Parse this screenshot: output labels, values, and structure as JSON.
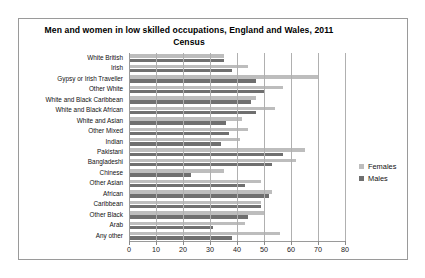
{
  "chart_data": {
    "type": "bar",
    "orientation": "horizontal",
    "title": "Men and women in low skilled occupations, England and Wales, 2011 Census",
    "title_line1": "Men and women in low skilled occupations, England and Wales, 2011",
    "title_line2": "Census",
    "xlabel": "",
    "ylabel": "",
    "xlim": [
      0,
      80
    ],
    "xticks": [
      0,
      10,
      20,
      30,
      40,
      50,
      60,
      70,
      80
    ],
    "grid": true,
    "legend_position": "right",
    "categories": [
      "White British",
      "Irish",
      "Gypsy or Irish Traveller",
      "Other White",
      "White and Black Caribbean",
      "White and Black African",
      "White and Asian",
      "Other Mixed",
      "Indian",
      "Pakistani",
      "Bangladeshi",
      "Chinese",
      "Other Asian",
      "African",
      "Caribbean",
      "Other Black",
      "Arab",
      "Any other"
    ],
    "series": [
      {
        "name": "Females",
        "color": "#bdbdbd",
        "values": [
          35,
          44,
          70,
          57,
          47,
          54,
          42,
          44,
          41,
          65,
          62,
          35,
          49,
          53,
          49,
          50,
          43,
          56
        ]
      },
      {
        "name": "Males",
        "color": "#6f6f6f",
        "values": [
          35,
          38,
          47,
          50,
          45,
          47,
          36,
          37,
          34,
          57,
          53,
          23,
          43,
          52,
          49,
          44,
          31,
          38
        ]
      }
    ]
  },
  "legend": {
    "items": [
      {
        "label": "Females"
      },
      {
        "label": "Males"
      }
    ]
  }
}
